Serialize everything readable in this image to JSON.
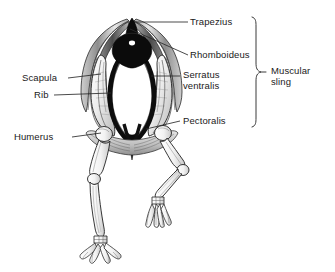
{
  "figure": {
    "ink_color": "#1a1a1a",
    "background_color": "#ffffff",
    "leader_color": "#2b2b2b",
    "bracket_color": "#3a3a3a"
  },
  "labels": {
    "trapezius": "Trapezius",
    "rhomboideus": "Rhomboideus",
    "serratus_line1": "Serratus",
    "serratus_line2": "ventralis",
    "pectoralis": "Pectoralis",
    "scapula": "Scapula",
    "rib": "Rib",
    "humerus": "Humerus",
    "muscular_line1": "Muscular",
    "muscular_line2": "sling"
  },
  "bracket": {
    "groups": [
      "Trapezius",
      "Rhomboideus",
      "Serratus ventralis",
      "Pectoralis"
    ],
    "group_label": "Muscular sling"
  },
  "anatomy_parts": [
    "Trapezius",
    "Rhomboideus",
    "Serratus ventralis",
    "Pectoralis",
    "Scapula",
    "Rib",
    "Humerus"
  ]
}
